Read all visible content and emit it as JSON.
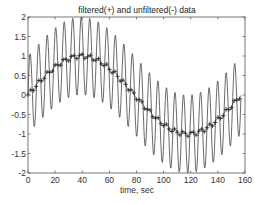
{
  "chart_data": {
    "type": "line",
    "title": "filtered(+) and unfiltered(-) data",
    "xlabel": "time, sec",
    "ylabel": "",
    "xlim": [
      0,
      160
    ],
    "ylim": [
      -2,
      2
    ],
    "xticks": [
      0,
      20,
      40,
      60,
      80,
      100,
      120,
      140,
      160
    ],
    "yticks": [
      -2,
      -1.5,
      -1,
      -0.5,
      0,
      0.5,
      1,
      1.5,
      2
    ],
    "grid": false,
    "legend": "none",
    "series": [
      {
        "name": "unfiltered",
        "style": "solid line",
        "formula": "sin(t/25) + sin(t)",
        "t_range": [
          0,
          157
        ],
        "t_step": 0.25,
        "description": "fast oscillation (period ~6.3 s, amplitude ~1) riding on slow sinusoid (period ~157 s)"
      },
      {
        "name": "filtered",
        "style": "+ markers with thin line",
        "formula": "sin(t/25) + 0.06*sin(t)",
        "t_range": [
          0,
          157
        ],
        "t_step": 1,
        "description": "slow sinusoid from ~0 up to ~0.95 near t=40, down to ~-0.95 near t=118, back to ~0.8 at t=157"
      }
    ],
    "sample_points": {
      "filtered": {
        "x": [
          0,
          10,
          20,
          30,
          40,
          50,
          60,
          70,
          80,
          90,
          100,
          110,
          120,
          130,
          140,
          150,
          157
        ],
        "y": [
          0.0,
          0.39,
          0.72,
          0.93,
          1.0,
          0.89,
          0.65,
          0.3,
          -0.09,
          -0.47,
          -0.76,
          -0.95,
          -1.0,
          -0.88,
          -0.63,
          -0.28,
          0.0
        ]
      }
    }
  }
}
